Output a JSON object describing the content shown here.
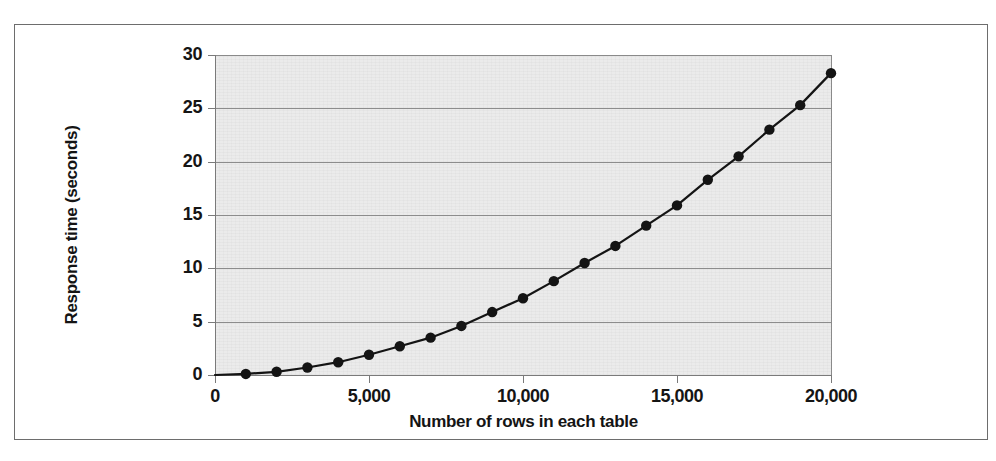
{
  "chart_data": {
    "type": "line",
    "title": "",
    "xlabel": "Number of rows in each table",
    "ylabel": "Response time (seconds)",
    "xlim": [
      0,
      20000
    ],
    "ylim": [
      0,
      30
    ],
    "grid": true,
    "legend": null,
    "marker": "filled-circle",
    "line_color": "#141414",
    "marker_color": "#141414",
    "plot_background": "#ebebeb",
    "gridline_color": "#8c8c8c",
    "xticks": [
      0,
      5000,
      10000,
      15000,
      20000
    ],
    "xtick_labels": [
      "0",
      "5,000",
      "10,000",
      "15,000",
      "20,000"
    ],
    "yticks": [
      0,
      5,
      10,
      15,
      20,
      25,
      30
    ],
    "ytick_labels": [
      "0",
      "5",
      "10",
      "15",
      "20",
      "25",
      "30"
    ],
    "x": [
      1000,
      2000,
      3000,
      4000,
      5000,
      6000,
      7000,
      8000,
      9000,
      10000,
      11000,
      12000,
      13000,
      14000,
      15000,
      16000,
      17000,
      18000,
      19000,
      20000
    ],
    "values": [
      0.1,
      0.3,
      0.7,
      1.2,
      1.9,
      2.7,
      3.5,
      4.6,
      5.9,
      7.2,
      8.8,
      10.5,
      12.1,
      14.0,
      15.9,
      18.3,
      20.5,
      23.0,
      25.3,
      28.3
    ],
    "series": [
      {
        "name": "Response time",
        "values": [
          0.1,
          0.3,
          0.7,
          1.2,
          1.9,
          2.7,
          3.5,
          4.6,
          5.9,
          7.2,
          8.8,
          10.5,
          12.1,
          14.0,
          15.9,
          18.3,
          20.5,
          23.0,
          25.3,
          28.3
        ]
      }
    ]
  },
  "figure": {
    "bleed_text_1": "ESPONSE TIME",
    "bleed_text_2": "OIN IS SO IMPORTANT"
  }
}
